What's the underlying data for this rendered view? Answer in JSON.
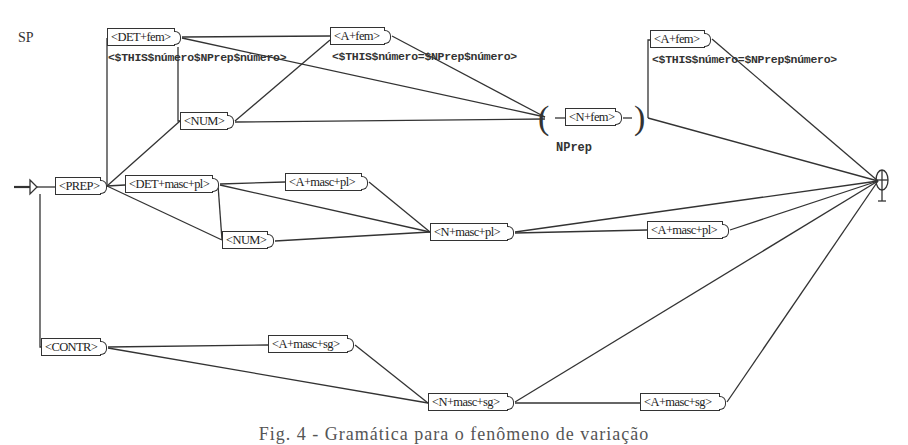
{
  "graph": {
    "name": "SP",
    "nodes": [
      {
        "id": "det_fem",
        "label": "<DET+fem>"
      },
      {
        "id": "a_fem_1",
        "label": "<A+fem>"
      },
      {
        "id": "num_1",
        "label": "<NUM>"
      },
      {
        "id": "n_fem",
        "label": "<N+fem>"
      },
      {
        "id": "a_fem_2",
        "label": "<A+fem>"
      },
      {
        "id": "prep",
        "label": "<PREP>"
      },
      {
        "id": "det_masc_pl",
        "label": "<DET+masc+pl>"
      },
      {
        "id": "a_masc_pl_1",
        "label": "<A+masc+pl>"
      },
      {
        "id": "num_2",
        "label": "<NUM>"
      },
      {
        "id": "n_masc_pl",
        "label": "<N+masc+pl>"
      },
      {
        "id": "a_masc_pl_2",
        "label": "<A+masc+pl>"
      },
      {
        "id": "contr",
        "label": "<CONTR>"
      },
      {
        "id": "a_masc_sg_1",
        "label": "<A+masc+sg>"
      },
      {
        "id": "n_masc_sg",
        "label": "<N+masc+sg>"
      },
      {
        "id": "a_masc_sg_2",
        "label": "<A+masc+sg>"
      }
    ],
    "annotations": [
      "<$THIS$número$NPrep$número>",
      "<$THIS$número=$NPrep$número>",
      "<$THIS$número=$NPrep$número>"
    ],
    "subgraph_label": "NPrep",
    "edges": [
      [
        "start",
        "prep"
      ],
      [
        "start",
        "contr"
      ],
      [
        "prep",
        "det_fem"
      ],
      [
        "prep",
        "num_1"
      ],
      [
        "prep",
        "det_masc_pl"
      ],
      [
        "prep",
        "num_2"
      ],
      [
        "det_fem",
        "a_fem_1"
      ],
      [
        "det_fem",
        "n_fem"
      ],
      [
        "det_fem",
        "num_1"
      ],
      [
        "num_1",
        "a_fem_1"
      ],
      [
        "num_1",
        "n_fem"
      ],
      [
        "a_fem_1",
        "n_fem"
      ],
      [
        "n_fem",
        "a_fem_2"
      ],
      [
        "n_fem",
        "end"
      ],
      [
        "a_fem_2",
        "end"
      ],
      [
        "det_masc_pl",
        "a_masc_pl_1"
      ],
      [
        "det_masc_pl",
        "n_masc_pl"
      ],
      [
        "det_masc_pl",
        "num_2"
      ],
      [
        "num_2",
        "n_masc_pl"
      ],
      [
        "a_masc_pl_1",
        "n_masc_pl"
      ],
      [
        "n_masc_pl",
        "a_masc_pl_2"
      ],
      [
        "n_masc_pl",
        "end"
      ],
      [
        "a_masc_pl_2",
        "end"
      ],
      [
        "contr",
        "a_masc_sg_1"
      ],
      [
        "contr",
        "n_masc_sg"
      ],
      [
        "a_masc_sg_1",
        "n_masc_sg"
      ],
      [
        "n_masc_sg",
        "a_masc_sg_2"
      ],
      [
        "n_masc_sg",
        "end"
      ],
      [
        "a_masc_sg_2",
        "end"
      ]
    ]
  },
  "caption": "Fig. 4 - Gramática para o fenômeno de variação"
}
